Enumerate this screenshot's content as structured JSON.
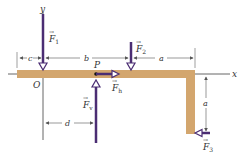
{
  "diagram": {
    "type": "statics-free-body-diagram",
    "colors": {
      "beam": "#d3a66e",
      "beam_edge": "#b8874a",
      "force_vector": "#4b2d73",
      "axis": "#666666",
      "dimension": "#555555",
      "label": "#333333",
      "background": "#ffffff"
    },
    "axes": {
      "x_label": "x",
      "y_label": "y",
      "origin_label": "O"
    },
    "point": {
      "label": "P"
    },
    "forces": [
      {
        "id": "F1",
        "symbol": "F",
        "subscript": "1",
        "direction": "down"
      },
      {
        "id": "F2",
        "symbol": "F",
        "subscript": "2",
        "direction": "down"
      },
      {
        "id": "Fh",
        "symbol": "F",
        "subscript": "h",
        "direction": "right"
      },
      {
        "id": "Fv",
        "symbol": "F",
        "subscript": "v",
        "direction": "up"
      },
      {
        "id": "F3",
        "symbol": "F",
        "subscript": "3",
        "direction": "left"
      }
    ],
    "dimensions": [
      {
        "id": "c",
        "label": "c"
      },
      {
        "id": "b",
        "label": "b"
      },
      {
        "id": "a_horizontal",
        "label": "a"
      },
      {
        "id": "a_vertical",
        "label": "a"
      },
      {
        "id": "d",
        "label": "d"
      }
    ]
  }
}
